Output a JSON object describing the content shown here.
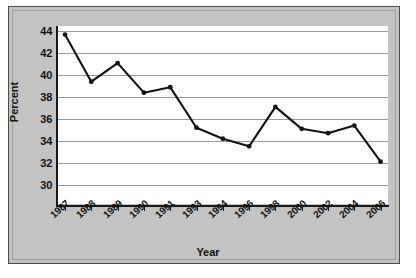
{
  "chart_data": {
    "type": "line",
    "title": "",
    "xlabel": "Year",
    "ylabel": "Percent",
    "categories": [
      "1987",
      "1988",
      "1989",
      "1990",
      "1991",
      "1993",
      "1994",
      "1996",
      "1998",
      "2000",
      "2002",
      "2004",
      "2006"
    ],
    "values": [
      43.7,
      39.4,
      41.1,
      38.4,
      38.9,
      35.2,
      34.2,
      33.5,
      37.1,
      35.1,
      34.7,
      35.4,
      32.1
    ],
    "series": [
      {
        "name": "Percent",
        "values": [
          43.7,
          39.4,
          41.1,
          38.4,
          38.9,
          35.2,
          34.2,
          33.5,
          37.1,
          35.1,
          34.7,
          35.4,
          32.1
        ]
      }
    ],
    "ylim": [
      30,
      44
    ],
    "ytick_labels": [
      "30",
      "32",
      "34",
      "36",
      "38",
      "40",
      "42",
      "44"
    ],
    "ytick_values": [
      30,
      32,
      34,
      36,
      38,
      40,
      42,
      44
    ],
    "grid": "horizontal",
    "legend": "none",
    "line_color": "#111111",
    "marker": "circle",
    "marker_color": "#111111",
    "plot_background": "#ffffff",
    "panel_background": "#c3c3c3",
    "gridline_color": "#9a9a9a"
  },
  "axes": {
    "y_title": "Percent",
    "x_title": "Year"
  }
}
